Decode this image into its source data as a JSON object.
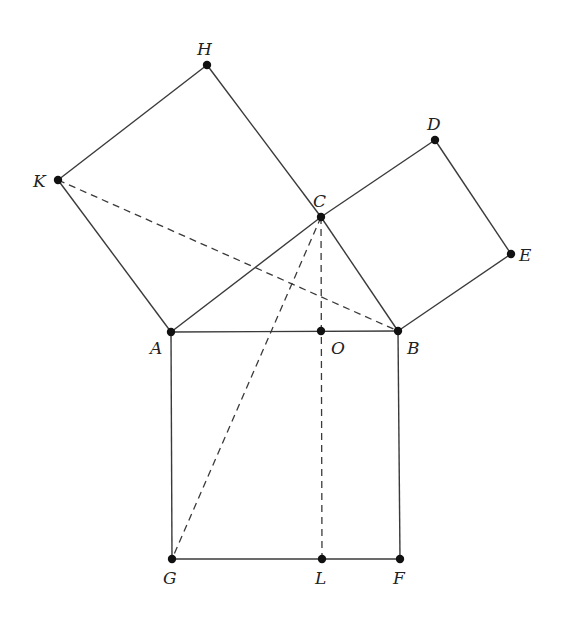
{
  "diagram": {
    "title": "",
    "points": {
      "H": {
        "label": "H",
        "x": 207,
        "y": 65,
        "lx": 197,
        "ly": 55
      },
      "K": {
        "label": "K",
        "x": 58,
        "y": 180,
        "lx": 33,
        "ly": 187
      },
      "D": {
        "label": "D",
        "x": 435,
        "y": 140,
        "lx": 427,
        "ly": 130
      },
      "C": {
        "label": "C",
        "x": 321,
        "y": 217,
        "lx": 313,
        "ly": 207
      },
      "E": {
        "label": "E",
        "x": 511,
        "y": 254,
        "lx": 519,
        "ly": 261
      },
      "A": {
        "label": "A",
        "x": 171,
        "y": 332,
        "lx": 150,
        "ly": 354
      },
      "O": {
        "label": "O",
        "x": 321,
        "y": 331,
        "lx": 331,
        "ly": 354
      },
      "B": {
        "label": "B",
        "x": 398,
        "y": 331,
        "lx": 407,
        "ly": 354
      },
      "G": {
        "label": "G",
        "x": 172,
        "y": 559,
        "lx": 163,
        "ly": 584
      },
      "L": {
        "label": "L",
        "x": 322,
        "y": 559,
        "lx": 315,
        "ly": 584
      },
      "F": {
        "label": "F",
        "x": 400,
        "y": 559,
        "lx": 393,
        "ly": 584
      }
    },
    "solid_segments": [
      [
        "A",
        "C"
      ],
      [
        "C",
        "B"
      ],
      [
        "A",
        "B"
      ],
      [
        "A",
        "K"
      ],
      [
        "K",
        "H"
      ],
      [
        "H",
        "C"
      ],
      [
        "C",
        "D"
      ],
      [
        "D",
        "E"
      ],
      [
        "E",
        "B"
      ],
      [
        "A",
        "G"
      ],
      [
        "G",
        "F"
      ],
      [
        "F",
        "B"
      ]
    ],
    "dashed_segments": [
      [
        "K",
        "B"
      ],
      [
        "C",
        "G"
      ],
      [
        "C",
        "L"
      ]
    ],
    "colors": {
      "stroke": "#3a3a3a",
      "point": "#111111",
      "background": "#ffffff"
    }
  }
}
